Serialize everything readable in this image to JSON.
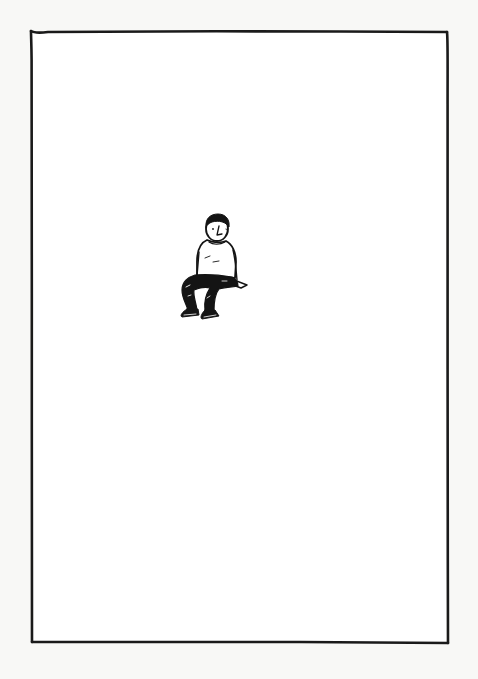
{
  "illustration": {
    "description": "Hand-drawn ink rectangular frame with a small seated man figure",
    "paper_color": "#f8f8f6",
    "ink_color": "#1a1a1a",
    "frame": {
      "top_left": [
        31,
        31
      ],
      "top_right": [
        447,
        32
      ],
      "bottom_right": [
        448,
        643
      ],
      "bottom_left": [
        32,
        642
      ]
    },
    "figure": {
      "subject": "seated-man",
      "bounding_box": [
        178,
        215,
        250,
        322
      ],
      "shirt": "white long-sleeve",
      "pants": "black",
      "shoes": "black"
    }
  }
}
